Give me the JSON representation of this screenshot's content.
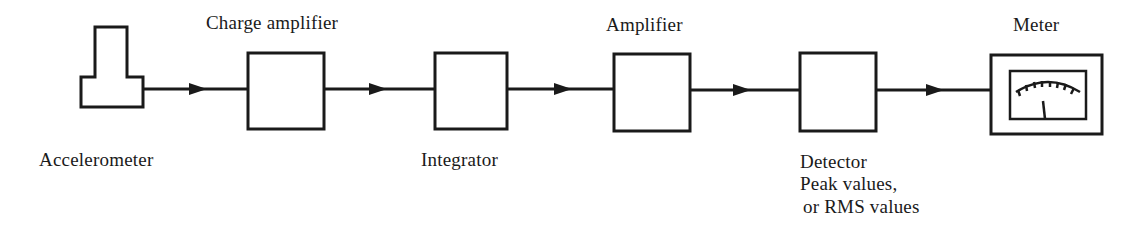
{
  "diagram": {
    "type": "signal-chain block diagram",
    "flow_direction": "left-to-right",
    "stroke_color": "#1a1a1a",
    "background": "#ffffff",
    "blocks": [
      {
        "id": "accelerometer",
        "label": "Accelerometer",
        "shape": "transducer"
      },
      {
        "id": "charge-amplifier",
        "label": "Charge amplifier",
        "shape": "box"
      },
      {
        "id": "integrator",
        "label": "Integrator",
        "shape": "box"
      },
      {
        "id": "amplifier",
        "label": "Amplifier",
        "shape": "box"
      },
      {
        "id": "detector",
        "label": "Detector",
        "sublabel_1": "Peak values,",
        "sublabel_2": "or RMS values",
        "shape": "box"
      },
      {
        "id": "meter",
        "label": "Meter",
        "shape": "analog-meter"
      }
    ],
    "connections": [
      {
        "from": "accelerometer",
        "to": "charge-amplifier"
      },
      {
        "from": "charge-amplifier",
        "to": "integrator"
      },
      {
        "from": "integrator",
        "to": "amplifier"
      },
      {
        "from": "amplifier",
        "to": "detector"
      },
      {
        "from": "detector",
        "to": "meter"
      }
    ]
  }
}
